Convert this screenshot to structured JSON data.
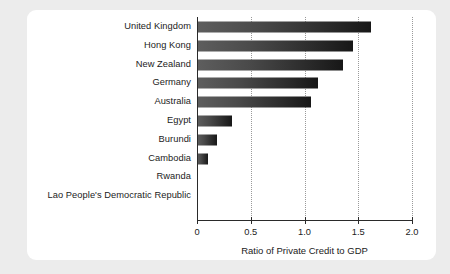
{
  "chart_data": {
    "type": "bar",
    "orientation": "horizontal",
    "title": "",
    "subtitle": "",
    "xlabel": "Ratio of Private Credit to GDP",
    "ylabel": "",
    "xlim": [
      0,
      2.0
    ],
    "xticks": [
      "0",
      "0.5",
      "1.0",
      "1.5",
      "2.0"
    ],
    "xtick_values": [
      0,
      0.5,
      1.0,
      1.5,
      2.0
    ],
    "grid": "vertical-dotted",
    "legend": "none",
    "categories": [
      "United Kingdom",
      "Hong Kong",
      "New Zealand",
      "Germany",
      "Australia",
      "Egypt",
      "Burundi",
      "Cambodia",
      "Rwanda",
      "Lao People's Democratic Republic"
    ],
    "values": [
      1.62,
      1.45,
      1.36,
      1.13,
      1.06,
      0.33,
      0.19,
      0.1,
      0,
      0
    ],
    "series": [
      {
        "name": "Ratio of Private Credit to GDP",
        "values": [
          1.62,
          1.45,
          1.36,
          1.13,
          1.06,
          0.33,
          0.19,
          0.1,
          0,
          0
        ]
      }
    ],
    "colors": {
      "bar_gradient_start": "#5e5e5e",
      "bar_gradient_end": "#171717",
      "axis": "#2a2a2a",
      "gridline": "#9a9a9a",
      "panel_background": "#ffffff",
      "figure_background": "#ececec",
      "text": "#1b1b1b"
    }
  }
}
